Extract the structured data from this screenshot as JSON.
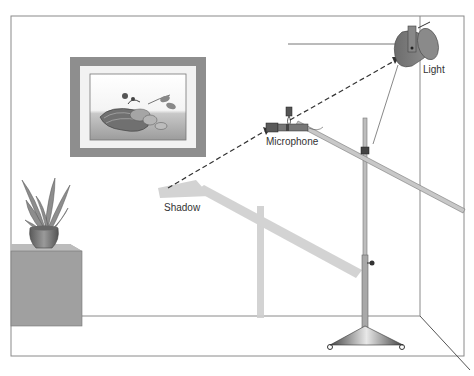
{
  "diagram": {
    "labels": {
      "light": "Light",
      "microphone": "Microphone",
      "shadow": "Shadow"
    },
    "colors": {
      "wall_line": "#888888",
      "frame": "#8a8a8a",
      "frame_mat": "#f2f2f2",
      "shadow": "#cfcfcf",
      "stand": "#9a9a9a",
      "light_body": "#7a7a7a",
      "cabinet_front": "#9c9c9c",
      "cabinet_top": "#b9b9b9",
      "pot": "#6f6f6f",
      "leaves": "#8f8f8f",
      "dashed_line": "#333333"
    },
    "elements": [
      {
        "name": "room-walls",
        "description": "Room corner outline"
      },
      {
        "name": "framed-picture",
        "description": "Picture on wall showing a basket of fruit/vegetables"
      },
      {
        "name": "plant-on-cabinet",
        "description": "Potted plant on a box cabinet"
      },
      {
        "name": "light",
        "description": "Spot light mounted near ceiling"
      },
      {
        "name": "microphone",
        "description": "Microphone on boom arm"
      },
      {
        "name": "boom-stand",
        "description": "Microphone boom stand with tripod base"
      },
      {
        "name": "shadow",
        "description": "Shadow of microphone boom on wall"
      },
      {
        "name": "light-ray",
        "description": "Dashed line from shadow through microphone to light"
      }
    ]
  }
}
